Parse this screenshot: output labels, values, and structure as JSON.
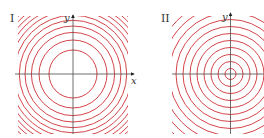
{
  "plots": [
    {
      "id": "I",
      "label": "I",
      "x_label": "x",
      "y_label": "y",
      "center": [
        73,
        74
      ],
      "clip": [
        18,
        16,
        128,
        134
      ],
      "radii": [
        24,
        34,
        41.6,
        48,
        53.7,
        58.8,
        63.5,
        67.9,
        72,
        75.9,
        79.6,
        83.1
      ],
      "description": "Level curves of a paraboloid: circles with radii proportional to sqrt(k)"
    },
    {
      "id": "II",
      "label": "II",
      "x_label": "",
      "y_label": "y",
      "center": [
        230.5,
        74
      ],
      "clip": [
        172,
        16,
        264,
        134
      ],
      "radii": [
        5.5,
        12.5,
        19.5,
        26.5,
        33.5,
        40.5,
        47.5,
        54.5,
        61.5,
        68.5,
        75.5,
        82.5
      ],
      "description": "Level curves of a cone: equally spaced concentric circles"
    }
  ],
  "colors": {
    "contour": "#d4454a",
    "axis": "#4a4a4a",
    "background": "#ffffff"
  }
}
